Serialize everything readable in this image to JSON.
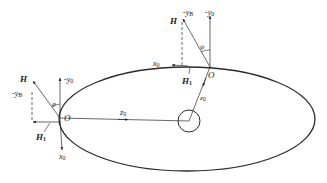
{
  "diagram": {
    "type": "orbit-geometry",
    "colors": {
      "stroke": "#2a2a2a",
      "background": "#ffffff"
    },
    "ellipse": {
      "cx": 187,
      "cy": 119,
      "rx": 128,
      "ry": 52
    },
    "central_body": {
      "cx": 189,
      "cy": 121,
      "r": 11
    },
    "left_point": {
      "origin_label": "O",
      "H_label": "H",
      "H1_label": "H",
      "H1_sub": "1",
      "yB_label": "-y",
      "yB_sub": "B",
      "y0_label": "-y",
      "y0_sub": "0",
      "x0_label": "x",
      "x0_sub": "0",
      "z0_label": "z",
      "z0_sub": "0",
      "angle_label": "φ"
    },
    "top_point": {
      "origin_label": "O",
      "H_label": "H",
      "H1_label": "H",
      "H1_sub": "1",
      "yB_label": "-y",
      "yB_sub": "B",
      "y0_label": "-y",
      "y0_sub": "0",
      "x0_label": "x",
      "x0_sub": "0",
      "z0_label": "z",
      "z0_sub": "0",
      "angle_label": "ψ"
    }
  }
}
